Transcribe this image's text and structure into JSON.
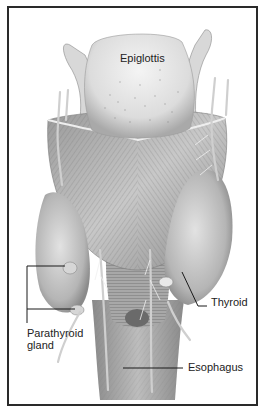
{
  "figure": {
    "labels": {
      "epiglottis": "Epiglottis",
      "thyroid": "Thyroid",
      "parathyroid_line1": "Parathyroid",
      "parathyroid_line2": "gland",
      "esophagus": "Esophagus"
    },
    "colors": {
      "frame": "#2a2a2a",
      "leader_line": "#1a1a1a",
      "tissue_light": "#e4e4e4",
      "tissue_mid": "#b8b8b8",
      "tissue_dark": "#7a7a7a",
      "background": "#ffffff"
    }
  }
}
